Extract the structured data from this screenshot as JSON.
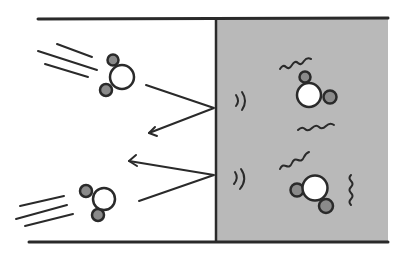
{
  "diagram": {
    "colors": {
      "background": "#ffffff",
      "condensed_region": "#b9b9b9",
      "outline": "#2a2a2a",
      "hydrogen_fill": "#8a8a8a",
      "oxygen_fill": "#ffffff"
    },
    "regions": [
      {
        "name": "gas-region",
        "x": 38,
        "width": 178
      },
      {
        "name": "condensed-region",
        "x": 216,
        "width": 172
      }
    ],
    "molecules": [
      {
        "name": "incoming-molecule-top",
        "region": "gas",
        "cx": 122,
        "cy": 77
      },
      {
        "name": "incoming-molecule-bottom",
        "region": "gas",
        "cx": 104,
        "cy": 199
      },
      {
        "name": "vibrating-molecule-top",
        "region": "condensed",
        "cx": 309,
        "cy": 95
      },
      {
        "name": "vibrating-molecule-bottom",
        "region": "condensed",
        "cx": 315,
        "cy": 188
      }
    ],
    "trajectories": [
      {
        "name": "bounce-path-top",
        "impact": [
          214,
          108
        ]
      },
      {
        "name": "bounce-path-bottom",
        "impact": [
          214,
          175
        ]
      }
    ]
  }
}
